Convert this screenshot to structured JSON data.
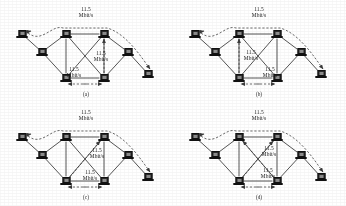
{
  "figure": {
    "background_color": "#ffffff",
    "line_color": "#2a2a2a",
    "dashed_color": "#3a3a3a",
    "node_color": "#2b2b2b",
    "bandwidth_value": "11.5",
    "bandwidth_unit": "Mbit/s",
    "panels": [
      {
        "id": "a",
        "caption": "(a)",
        "labels": [
          {
            "name": "top-flow-label",
            "value": "11.5",
            "unit": "Mbit/s",
            "x": 86,
            "y": 12
          },
          {
            "name": "right-diagonal-flow-label",
            "value": "11.5",
            "unit": "Mbit/s",
            "x": 101,
            "y": 56
          },
          {
            "name": "bottom-flow-label",
            "value": "11.5",
            "unit": "Mbit/s",
            "x": 74,
            "y": 72
          }
        ]
      },
      {
        "id": "b",
        "caption": "(b)",
        "labels": [
          {
            "name": "top-flow-label",
            "value": "11.5",
            "unit": "Mbit/s",
            "x": 86,
            "y": 12
          },
          {
            "name": "left-vertical-flow-label",
            "value": "11.5",
            "unit": "Mbit/s",
            "x": 78,
            "y": 55
          },
          {
            "name": "bottom-diagonal-flow-label",
            "value": "11.5",
            "unit": "Mbit/s",
            "x": 97,
            "y": 72
          }
        ]
      },
      {
        "id": "c",
        "caption": "(c)",
        "labels": [
          {
            "name": "top-flow-label",
            "value": "11.5",
            "unit": "Mbit/s",
            "x": 86,
            "y": 12
          },
          {
            "name": "right-diagonal-flow-label",
            "value": "11.5",
            "unit": "Mbit/s",
            "x": 97,
            "y": 50
          },
          {
            "name": "bottom-flow-label",
            "value": "11.5",
            "unit": "Mbit/s",
            "x": 90,
            "y": 72
          }
        ]
      },
      {
        "id": "d",
        "caption": "(d)",
        "labels": [
          {
            "name": "top-flow-label",
            "value": "11.5",
            "unit": "Mbit/s",
            "x": 86,
            "y": 12
          },
          {
            "name": "upper-diagonal-flow-label",
            "value": "11.5",
            "unit": "Mbit/s",
            "x": 96,
            "y": 48
          },
          {
            "name": "lower-diagonal-flow-label",
            "value": "11.5",
            "unit": "Mbit/s",
            "x": 95,
            "y": 70
          }
        ]
      }
    ],
    "nodes": [
      {
        "name": "node-west-outer",
        "x": 22,
        "y": 34
      },
      {
        "name": "node-west-inner",
        "x": 42,
        "y": 52
      },
      {
        "name": "node-core-top-left",
        "x": 66,
        "y": 34
      },
      {
        "name": "node-core-top-right",
        "x": 104,
        "y": 34
      },
      {
        "name": "node-core-bottom-left",
        "x": 66,
        "y": 78
      },
      {
        "name": "node-core-bottom-right",
        "x": 104,
        "y": 78
      },
      {
        "name": "node-east-inner",
        "x": 128,
        "y": 52
      },
      {
        "name": "node-east-outer",
        "x": 148,
        "y": 74
      }
    ],
    "solid_links": [
      {
        "name": "link-core-top",
        "from": "node-core-top-left",
        "to": "node-core-top-right"
      },
      {
        "name": "link-core-left",
        "from": "node-core-top-left",
        "to": "node-core-bottom-left"
      },
      {
        "name": "link-core-right",
        "from": "node-core-top-right",
        "to": "node-core-bottom-right"
      },
      {
        "name": "link-core-bottom",
        "from": "node-core-bottom-left",
        "to": "node-core-bottom-right"
      },
      {
        "name": "link-core-diagonal-down",
        "from": "node-core-top-left",
        "to": "node-core-bottom-right"
      },
      {
        "name": "link-core-diagonal-up",
        "from": "node-core-top-right",
        "to": "node-core-bottom-left"
      },
      {
        "name": "link-west-outer-to-west-inner",
        "from": "node-west-outer",
        "to": "node-west-inner"
      },
      {
        "name": "link-west-inner-to-core-top-left",
        "from": "node-west-inner",
        "to": "node-core-top-left"
      },
      {
        "name": "link-west-inner-to-core-bottom-left",
        "from": "node-west-inner",
        "to": "node-core-bottom-left"
      },
      {
        "name": "link-core-top-right-to-east-inner",
        "from": "node-core-top-right",
        "to": "node-east-inner"
      },
      {
        "name": "link-core-bottom-right-to-east-inner",
        "from": "node-core-bottom-right",
        "to": "node-east-inner"
      },
      {
        "name": "link-east-inner-to-east-outer",
        "from": "node-east-inner",
        "to": "node-east-outer"
      }
    ],
    "dashed_flows": [
      {
        "name": "flow-west-outer-to-core-top-left"
      },
      {
        "name": "flow-core-top-arc-to-east"
      },
      {
        "name": "flow-core-bottom-horizontal"
      }
    ]
  }
}
